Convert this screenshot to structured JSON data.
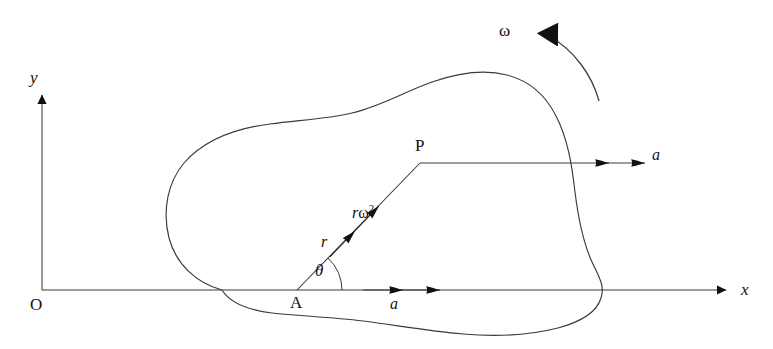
{
  "figure": {
    "kind": "mechanics-diagram",
    "background_color": "#ffffff",
    "ink_color": "#3a3a3a",
    "label_color": "#111111"
  },
  "axes": {
    "origin_label": "O",
    "x_label": "x",
    "y_label": "y",
    "x_axis": {
      "x1": 42,
      "y1": 290,
      "x2": 733,
      "y2": 290
    },
    "y_axis": {
      "x1": 42,
      "y1": 290,
      "x2": 42,
      "y2": 86
    }
  },
  "points": [
    {
      "name": "point-a",
      "label": "A",
      "x": 297,
      "y": 290,
      "label_x": 292,
      "label_y": 296
    },
    {
      "name": "point-p",
      "label": "P",
      "x": 420,
      "y": 163,
      "label_x": 415,
      "label_y": 137
    }
  ],
  "vectors": {
    "radius": {
      "label": "r",
      "label_x": 322,
      "label_y": 234,
      "from_x": 297,
      "from_y": 290,
      "to_x": 420,
      "to_y": 163
    },
    "centripetal": {
      "label_r": "r",
      "label_omega": "ω",
      "label_exponent": "2",
      "label_x": 352,
      "label_y": 205,
      "arrow_tip_x": 383,
      "arrow_tip_y": 199
    },
    "accel_at_p": {
      "label": "a",
      "label_x": 654,
      "label_y": 146,
      "line_from_x": 420,
      "line_from_y": 163,
      "line_to_x": 645,
      "line_to_y": 163
    },
    "accel_at_a": {
      "label": "a",
      "label_x": 392,
      "label_y": 297,
      "arrow_start_x": 363,
      "arrow_start_y": 290,
      "arrow_end_x": 440,
      "arrow_end_y": 290
    },
    "angular_velocity": {
      "label": "ω",
      "label_x": 500,
      "label_y": 22,
      "arc_start_x": 599,
      "arc_start_y": 101,
      "arc_end_x": 543,
      "arc_end_y": 33
    }
  },
  "angle": {
    "label": "θ",
    "label_x": 317,
    "label_y": 262,
    "vertex_x": 297,
    "vertex_y": 290,
    "radius_px": 45,
    "degrees": 46
  },
  "body_outline": {
    "name": "rigid-body-lamina",
    "path": "M 222 290 C 196 283 176 264 169 238 C 162 210 168 182 184 163 C 205 139 238 128 270 124 C 300 120 327 119 352 113 C 381 106 404 92 432 82 C 458 73 484 69 507 75 C 530 81 546 96 556 116 C 568 139 572 166 575 192 C 578 216 582 240 592 262 C 599 277 605 286 601 298 C 597 312 580 322 558 328 C 530 335 497 337 463 334 C 428 331 395 325 363 321 C 330 317 299 316 272 313 C 248 310 230 303 222 290 Z"
  }
}
